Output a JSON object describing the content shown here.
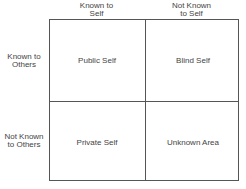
{
  "diagram": {
    "columns": [
      {
        "label_line1": "Known to",
        "label_line2": "Self"
      },
      {
        "label_line1": "Not Known",
        "label_line2": "to Self"
      }
    ],
    "rows": [
      {
        "label_line1": "Known to",
        "label_line2": "Others"
      },
      {
        "label_line1": "Not Known",
        "label_line2": "to Others"
      }
    ],
    "cells": [
      [
        "Public Self",
        "Blind Self"
      ],
      [
        "Private Self",
        "Unknown Area"
      ]
    ],
    "colors": {
      "line": "#555555",
      "text": "#444444",
      "background": "#ffffff"
    }
  }
}
